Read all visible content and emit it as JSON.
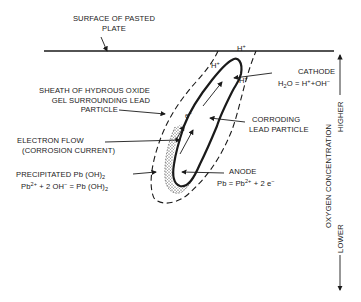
{
  "diagram": {
    "labels": {
      "surface_line1": "SURFACE OF PASTED",
      "surface_line2": "PLATE",
      "sheath_line1": "SHEATH OF HYDROUS OXIDE",
      "sheath_line2": "GEL SURROUNDING LEAD",
      "sheath_line3": "PARTICLE",
      "electron_line1": "ELECTRON FLOW",
      "electron_line2": "(CORROSION CURRENT)",
      "precip_line1_a": "PRECIPITATED Pb (OH)",
      "precip_line1_sub": "2",
      "precip_eq_a": "Pb",
      "precip_eq_sup1": "2+",
      "precip_eq_b": " + 2  OH",
      "precip_eq_sup2": "−",
      "precip_eq_c": " = Pb (OH)",
      "precip_eq_sub": "2",
      "cathode": "CATHODE",
      "cathode_eq_a": "H",
      "cathode_eq_sub": "2",
      "cathode_eq_b": "O = H",
      "cathode_eq_sup1": "+",
      "cathode_eq_c": "+OH",
      "cathode_eq_sup2": "−",
      "corroding_line1": "CORRODING",
      "corroding_line2": "LEAD PARTICLE",
      "anode": "ANODE",
      "anode_eq_a": "Pb = Pb",
      "anode_eq_sup1": "2+",
      "anode_eq_b": "  + 2 e",
      "anode_eq_sup2": "−",
      "h_plus": "H",
      "plus": "+",
      "e_minus": "e",
      "minus": "−",
      "axis_label": "OXYGEN CONCENTRATION",
      "axis_high": "HIGHER",
      "axis_low": "LOWER"
    },
    "colors": {
      "ink": "#1a1a1a",
      "background": "#ffffff"
    }
  }
}
